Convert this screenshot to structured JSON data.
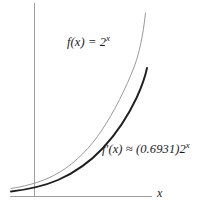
{
  "figure": {
    "background_color": "#ffffff",
    "axes": {
      "x_axis_label": "x",
      "x_axis_color": "#8c8c8c",
      "y_axis_color": "#8c8c8c",
      "x_axis_start_px": 10,
      "x_axis_end_px": 152,
      "x_axis_y_px": 196,
      "y_axis_x_px": 34,
      "y_axis_top_px": 3,
      "y_axis_bottom_px": 196
    },
    "curves": [
      {
        "id": "f",
        "label": "f(x) = 2",
        "label_exponent": "x",
        "color": "#9a9a9a",
        "stroke_width": 1.0,
        "description": "exponential-curve-f"
      },
      {
        "id": "fprime",
        "label_head": "f",
        "label_prime": "′",
        "label_body": "(x) ≈ (0.6931)2",
        "label_exponent": "x",
        "color": "#1f1f1f",
        "stroke_width": 1.9,
        "description": "exponential-curve-f-prime"
      }
    ],
    "label_f_text": "f(x) = 2",
    "label_f_exponent": "x",
    "label_fprime_text": "f′(x) ≈ (0.6931)2",
    "label_fprime_exponent": "x",
    "constant_value": "0.6931",
    "base_value": "2"
  }
}
